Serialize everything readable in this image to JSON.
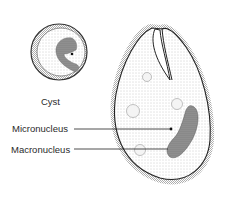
{
  "diagram": {
    "type": "biological-illustration",
    "labels": {
      "cyst": "Cyst",
      "micronucleus": "Micronucleus",
      "macronucleus": "Macronucleus"
    },
    "colors": {
      "background": "#ffffff",
      "ink": "#2a2a2a",
      "stipple": "#8a8a8a",
      "nucleus_fill": "#7a7a7a"
    }
  }
}
